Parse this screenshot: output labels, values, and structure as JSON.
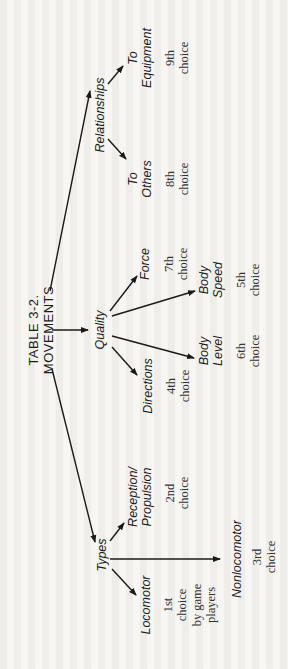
{
  "diagram": {
    "title_line1": "TABLE 3-2.",
    "title_line2": "MOVEMENTS",
    "categories": {
      "types": {
        "label": "Types",
        "children": [
          {
            "label_line1": "Locomotor",
            "label_line2": "",
            "choice_line1": "1st",
            "choice_line2": "choice",
            "choice_line3": "by game",
            "choice_line4": "players"
          },
          {
            "label_line1": "Reception/",
            "label_line2": "Propulsion",
            "choice_line1": "2nd",
            "choice_line2": "choice"
          },
          {
            "label_line1": "Nonlocomotor",
            "label_line2": "",
            "choice_line1": "3rd",
            "choice_line2": "choice"
          }
        ]
      },
      "quality": {
        "label": "Quality",
        "children": [
          {
            "label_line1": "Directions",
            "label_line2": "",
            "choice_line1": "4th",
            "choice_line2": "choice"
          },
          {
            "label_line1": "Body",
            "label_line2": "Level",
            "choice_line1": "6th",
            "choice_line2": "choice"
          },
          {
            "label_line1": "Body",
            "label_line2": "Speed",
            "choice_line1": "5th",
            "choice_line2": "choice"
          },
          {
            "label_line1": "Force",
            "label_line2": "",
            "choice_line1": "7th",
            "choice_line2": "choice"
          }
        ]
      },
      "relationships": {
        "label": "Relationships",
        "children": [
          {
            "label_line1": "To",
            "label_line2": "Others",
            "choice_line1": "8th",
            "choice_line2": "choice"
          },
          {
            "label_line1": "To",
            "label_line2": "Equipment",
            "choice_line1": "9th",
            "choice_line2": "choice"
          }
        ]
      }
    },
    "colors": {
      "ink": "#1a1a1a",
      "paper": "#f7f6f3"
    }
  }
}
